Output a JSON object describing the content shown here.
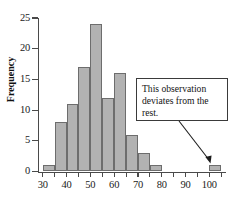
{
  "chart_data": {
    "type": "bar",
    "title": "",
    "xlabel": "",
    "ylabel": "Frequency",
    "grid": false,
    "legend": null,
    "bin_width": 5,
    "xlim": [
      28,
      107
    ],
    "ylim": [
      0,
      25
    ],
    "x_ticks_major": [
      30,
      40,
      50,
      60,
      70,
      80,
      90,
      100
    ],
    "x_ticks_minor": [
      35,
      45,
      55,
      65,
      75,
      85,
      95,
      105
    ],
    "x_tick_labels": [
      "30",
      "40",
      "50",
      "60",
      "70",
      "80",
      "90",
      "100"
    ],
    "y_ticks": [
      0,
      5,
      10,
      15,
      20,
      25
    ],
    "y_tick_labels": [
      "0",
      "5",
      "10",
      "15",
      "20",
      "25"
    ],
    "categories": [
      "30-35",
      "35-40",
      "40-45",
      "45-50",
      "50-55",
      "55-60",
      "60-65",
      "65-70",
      "70-75",
      "75-80",
      "100-105"
    ],
    "bin_starts": [
      30,
      35,
      40,
      45,
      50,
      55,
      60,
      65,
      70,
      75,
      100
    ],
    "values": [
      1,
      8,
      11,
      17,
      24,
      12,
      16,
      6,
      3,
      1,
      1
    ],
    "bar_color": "#b2b2b2",
    "bar_edge_color": "#6d6d6d",
    "axis_color": "#4a4a4a",
    "annotations": [
      {
        "text": "This observation deviates from the rest.",
        "target_bin_start": 100,
        "target_value": 1
      }
    ]
  },
  "axis": {
    "y_title": "Frequency"
  },
  "annotation": {
    "text": "This observation deviates from the rest."
  }
}
